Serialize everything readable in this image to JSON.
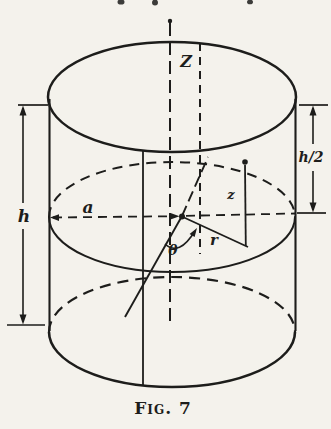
{
  "figure": {
    "caption": "Fig. 7",
    "labels": {
      "axis": "Z",
      "height": "h",
      "half_height": "h/2",
      "cylinder_radius": "a",
      "coord_z": "z",
      "coord_r": "r",
      "coord_theta": "θ"
    },
    "colors": {
      "ink": "#1d1d1b",
      "paper": "#f4f2ec"
    }
  }
}
